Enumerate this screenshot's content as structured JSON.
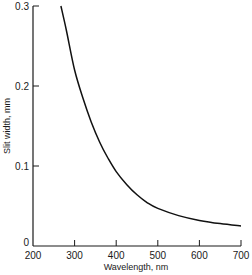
{
  "chart_data": {
    "type": "line",
    "title": "",
    "xlabel": "Wavelength, nm",
    "ylabel": "Slit width, mm",
    "xlim": [
      200,
      700
    ],
    "ylim": [
      0,
      0.3
    ],
    "x_ticks": [
      "200",
      "300",
      "400",
      "500",
      "600",
      "700"
    ],
    "y_ticks": [
      "0",
      "0.1",
      "0.2",
      "0.3"
    ],
    "grid": false,
    "legend": null,
    "series": [
      {
        "name": "Slit width",
        "x": [
          267,
          280,
          300,
          320,
          340,
          360,
          380,
          400,
          425,
          450,
          475,
          500,
          550,
          600,
          650,
          700
        ],
        "values": [
          0.3,
          0.27,
          0.22,
          0.185,
          0.155,
          0.13,
          0.11,
          0.093,
          0.077,
          0.064,
          0.054,
          0.047,
          0.038,
          0.032,
          0.028,
          0.025
        ]
      }
    ]
  }
}
